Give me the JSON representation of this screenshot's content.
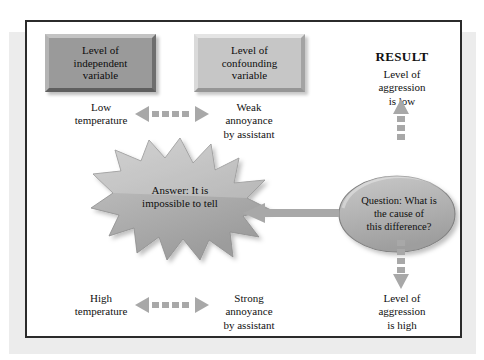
{
  "figure": {
    "frame_border_color": "#2b2b2b",
    "background_color": "#ffffff",
    "shadow_color": "#ececec"
  },
  "boxes": {
    "independent": {
      "name": "independent-variable-box",
      "text": "Level of\nindependent\nvariable",
      "line1": "Level of",
      "line2": "independent",
      "line3": "variable",
      "fill_color": "#9a9a9a"
    },
    "confounding": {
      "name": "confounding-variable-box",
      "text": "Level of\nconfounding\nvariable",
      "line1": "Level of",
      "line2": "confounding",
      "line3": "variable",
      "fill_color": "#c6c6c6"
    }
  },
  "labels": {
    "result_heading": "RESULT",
    "aggression_low_line1": "Level of",
    "aggression_low_line2": "aggression",
    "aggression_low_line3": "is low",
    "aggression_high_line1": "Level of",
    "aggression_high_line2": "aggression",
    "aggression_high_line3": "is high",
    "low_temp_line1": "Low",
    "low_temp_line2": "temperature",
    "weak_line1": "Weak",
    "weak_line2": "annoyance",
    "weak_line3": "by assistant",
    "high_temp_line1": "High",
    "high_temp_line2": "temperature",
    "strong_line1": "Strong",
    "strong_line2": "annoyance",
    "strong_line3": "by assistant"
  },
  "starburst": {
    "name": "answer-starburst",
    "line1": "Answer: It is",
    "line2": "impossible to tell",
    "fill_color": "#b3b3b3"
  },
  "ellipse": {
    "name": "question-ellipse",
    "line1": "Question: What is",
    "line2": "the cause of",
    "line3": "this difference?",
    "fill_color": "#b3b3b3"
  },
  "arrows": {
    "dashed_double_top": {
      "name": "dashed-double-arrow-top",
      "direction": "bidirectional-horizontal",
      "style": "dashed",
      "color": "#a8a8a8"
    },
    "dashed_double_bottom": {
      "name": "dashed-double-arrow-bottom",
      "direction": "bidirectional-horizontal",
      "style": "dashed",
      "color": "#a8a8a8"
    },
    "dashed_up_result": {
      "name": "dashed-up-arrow-result-low",
      "direction": "up",
      "style": "dashed",
      "color": "#a8a8a8"
    },
    "dashed_down_result": {
      "name": "dashed-down-arrow-result-high",
      "direction": "down",
      "style": "dashed",
      "color": "#a8a8a8"
    },
    "solid_left_answer": {
      "name": "solid-left-arrow-question-to-answer",
      "direction": "left",
      "style": "solid",
      "color": "#a8a8a8"
    }
  }
}
